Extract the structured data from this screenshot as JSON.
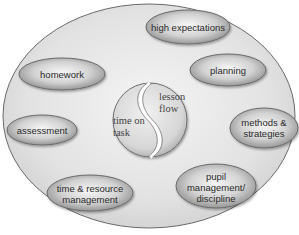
{
  "diagram": {
    "center": {
      "left_label": "time on\ntask",
      "right_label": "lesson\nflow"
    },
    "factors": [
      {
        "id": "high-expectations",
        "label": "high expectations"
      },
      {
        "id": "planning",
        "label": "planning"
      },
      {
        "id": "methods-strategies",
        "label": "methods &\nstrategies"
      },
      {
        "id": "pupil-management",
        "label": "pupil\nmanagement/\ndiscipline"
      },
      {
        "id": "time-resource-management",
        "label": "time & resource\nmanagement"
      },
      {
        "id": "assessment",
        "label": "assessment"
      },
      {
        "id": "homework",
        "label": "homework"
      }
    ],
    "colors": {
      "outer_fill": "#e4e4e4",
      "outer_stroke": "#6a6a6a",
      "pill_light": "#f2f2f2",
      "pill_dark": "#8c8c8c",
      "center_fill": "#d8d8d8",
      "text": "#2a2a2a"
    }
  }
}
